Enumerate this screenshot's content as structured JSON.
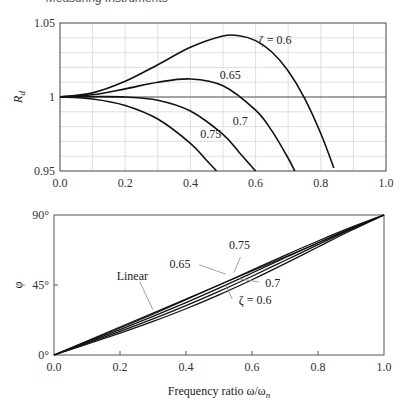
{
  "page": {
    "header": "Measuring Instruments"
  },
  "chart_data": [
    {
      "type": "line",
      "title": "",
      "xlabel": "",
      "ylabel": "R_d",
      "xlim": [
        0.0,
        1.0
      ],
      "ylim": [
        0.95,
        1.05
      ],
      "grid": true,
      "x_ticks": [
        "0.0",
        "0.2",
        "0.4",
        "0.6",
        "0.8",
        "1.0"
      ],
      "y_ticks": [
        "0.95",
        "1",
        "1.05"
      ],
      "reference_line": 1.0,
      "series": [
        {
          "name": "ζ = 0.6",
          "label": "ζ = 0.6",
          "x": [
            0,
            0.1,
            0.2,
            0.3,
            0.4,
            0.5,
            0.55,
            0.6,
            0.65,
            0.7,
            0.75,
            0.8,
            0.84
          ],
          "values": [
            1.0,
            1.0028,
            1.0106,
            1.0218,
            1.0336,
            1.0412,
            1.0414,
            1.0381,
            1.0304,
            1.0176,
            0.9993,
            0.9753,
            0.952
          ]
        },
        {
          "name": "ζ = 0.65",
          "label": "0.65",
          "x": [
            0,
            0.1,
            0.2,
            0.3,
            0.4,
            0.5,
            0.6,
            0.65,
            0.7,
            0.72
          ],
          "values": [
            1.0,
            1.0015,
            1.0055,
            1.01,
            1.0122,
            1.0076,
            0.9911,
            0.9771,
            0.9586,
            0.95
          ]
        },
        {
          "name": "ζ = 0.7",
          "label": "0.7",
          "x": [
            0,
            0.1,
            0.2,
            0.3,
            0.4,
            0.5,
            0.55,
            0.6
          ],
          "values": [
            1.0,
            1.0002,
            1.0,
            0.9978,
            0.9905,
            0.9747,
            0.9625,
            0.947
          ]
        },
        {
          "name": "ζ = 0.75",
          "label": "0.75",
          "x": [
            0,
            0.1,
            0.2,
            0.3,
            0.4,
            0.45,
            0.48
          ],
          "values": [
            1.0,
            0.9987,
            0.9943,
            0.9851,
            0.9687,
            0.9571,
            0.949
          ]
        }
      ],
      "annotations": [
        {
          "text": "ζ = 0.6",
          "x": 0.61,
          "y": 1.036
        },
        {
          "text": "0.65",
          "x": 0.49,
          "y": 1.012
        },
        {
          "text": "0.7",
          "x": 0.53,
          "y": 0.981
        },
        {
          "text": "0.75",
          "x": 0.43,
          "y": 0.972
        }
      ]
    },
    {
      "type": "line",
      "title": "",
      "xlabel": "Frequency ratio ω/ω",
      "xlabel_sub": "n",
      "ylabel": "φ",
      "xlim": [
        0.0,
        1.0
      ],
      "ylim": [
        0,
        90
      ],
      "grid": false,
      "x_ticks": [
        "0.0",
        "0.2",
        "0.4",
        "0.6",
        "0.8",
        "1.0"
      ],
      "y_ticks": [
        "0°",
        "45°",
        "90°"
      ],
      "series": [
        {
          "name": "Linear",
          "x": [
            0,
            1.0
          ],
          "values": [
            0,
            90
          ]
        },
        {
          "name": "ζ = 0.6",
          "x": [
            0,
            0.1,
            0.2,
            0.3,
            0.4,
            0.5,
            0.6,
            0.7,
            0.8,
            0.9,
            1.0
          ],
          "values": [
            0,
            6.91,
            14.04,
            21.58,
            29.74,
            38.66,
            48.37,
            58.74,
            69.44,
            80.02,
            90
          ]
        },
        {
          "name": "ζ = 0.65",
          "x": [
            0,
            0.1,
            0.2,
            0.3,
            0.4,
            0.5,
            0.6,
            0.7,
            0.8,
            0.9,
            1.0
          ],
          "values": [
            0,
            7.48,
            15.16,
            23.2,
            31.76,
            40.91,
            50.63,
            60.74,
            70.9,
            80.78,
            90
          ]
        },
        {
          "name": "ζ = 0.7",
          "x": [
            0,
            0.1,
            0.2,
            0.3,
            0.4,
            0.5,
            0.6,
            0.7,
            0.8,
            0.9,
            1.0
          ],
          "values": [
            0,
            8.05,
            16.26,
            24.78,
            33.69,
            43.03,
            52.7,
            62.5,
            72.18,
            81.42,
            90
          ]
        },
        {
          "name": "ζ = 0.75",
          "x": [
            0,
            0.1,
            0.2,
            0.3,
            0.4,
            0.5,
            0.6,
            0.7,
            0.8,
            0.9,
            1.0
          ],
          "values": [
            0,
            8.61,
            17.35,
            26.31,
            35.54,
            45.0,
            54.58,
            64.09,
            73.3,
            81.99,
            90
          ]
        }
      ],
      "annotations": [
        {
          "text": "Linear",
          "x": 0.19,
          "y": 48
        },
        {
          "text": "0.75",
          "x": 0.53,
          "y": 68
        },
        {
          "text": "0.65",
          "x": 0.35,
          "y": 56
        },
        {
          "text": "0.7",
          "x": 0.64,
          "y": 44
        },
        {
          "text": "ζ = 0.6",
          "x": 0.56,
          "y": 33
        }
      ]
    }
  ]
}
